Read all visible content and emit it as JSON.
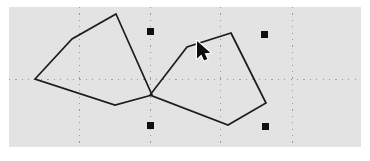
{
  "app": {
    "title": "Vector Drawing Canvas",
    "canvas_background_color": "#e3e3e3",
    "page_background_color": "#ffffff",
    "canvas": {
      "x": 9,
      "y": 7,
      "width": 352,
      "height": 140
    }
  },
  "guides": {
    "name": "snap-guide-lines",
    "color": "#9a9a9a",
    "style": "dotted",
    "vertical": [
      {
        "label": "guide-v-1",
        "x": 70
      },
      {
        "label": "guide-v-2",
        "x": 141
      },
      {
        "label": "guide-v-3",
        "x": 211
      },
      {
        "label": "guide-v-4",
        "x": 283
      }
    ],
    "horizontal": [
      {
        "label": "guide-h-1",
        "y": 72
      }
    ]
  },
  "shapes": [
    {
      "name": "polygon-left",
      "label": "Left quadrilateral",
      "stroke_color": "#1c1c1c",
      "stroke_width": 1.7,
      "fill": "none",
      "closed": true,
      "points": [
        {
          "x": 107,
          "y": 7
        },
        {
          "x": 143,
          "y": 88
        },
        {
          "x": 106,
          "y": 98
        },
        {
          "x": 26,
          "y": 72
        },
        {
          "x": 63,
          "y": 32
        }
      ]
    },
    {
      "name": "polygon-right",
      "label": "Right quadrilateral",
      "stroke_color": "#1c1c1c",
      "stroke_width": 1.7,
      "fill": "none",
      "closed": true,
      "points": [
        {
          "x": 222,
          "y": 26
        },
        {
          "x": 257,
          "y": 96
        },
        {
          "x": 219,
          "y": 118
        },
        {
          "x": 141,
          "y": 88
        },
        {
          "x": 178,
          "y": 40
        }
      ]
    }
  ],
  "handles": {
    "name": "selection-handles",
    "color": "#101010",
    "size": 7,
    "items": [
      {
        "label": "handle-top-left",
        "x": 141,
        "y": 24
      },
      {
        "label": "handle-top-right",
        "x": 255,
        "y": 27
      },
      {
        "label": "handle-bottom-left",
        "x": 141,
        "y": 118
      },
      {
        "label": "handle-bottom-right",
        "x": 256,
        "y": 119
      }
    ]
  },
  "cursor": {
    "name": "mouse-pointer",
    "type": "arrow",
    "x": 188,
    "y": 34,
    "color": "#0d0d0d"
  }
}
